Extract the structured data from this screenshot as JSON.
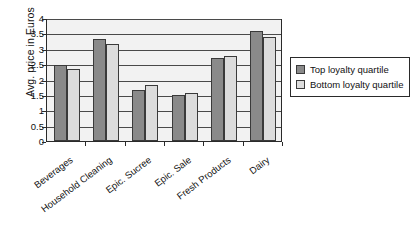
{
  "chart_data": {
    "type": "bar",
    "title": "",
    "xlabel": "",
    "ylabel": "Avg. price in Euros",
    "ylim": [
      0,
      4
    ],
    "ytick_step": 0.5,
    "yticks": [
      "0",
      "0.5",
      "1",
      "1.5",
      "2",
      "2.5",
      "3",
      "3.5",
      "4"
    ],
    "grid": true,
    "legend_position": "right",
    "categories": [
      "Beverages",
      "Household Cleaning",
      "Epic. Sucree",
      "Epic. Sale",
      "Fresh Products",
      "Dairy"
    ],
    "series": [
      {
        "name": "Top loyalty quartile",
        "color": "#8a8a8a",
        "values": [
          2.47,
          3.31,
          1.67,
          1.49,
          2.69,
          3.57
        ]
      },
      {
        "name": "Bottom loyalty quartile",
        "color": "#dcdcdc",
        "values": [
          2.33,
          3.16,
          1.81,
          1.55,
          2.76,
          3.38
        ]
      }
    ]
  },
  "legend": {
    "items": [
      {
        "label": "Top loyalty quartile"
      },
      {
        "label": "Bottom loyalty quartile"
      }
    ]
  }
}
